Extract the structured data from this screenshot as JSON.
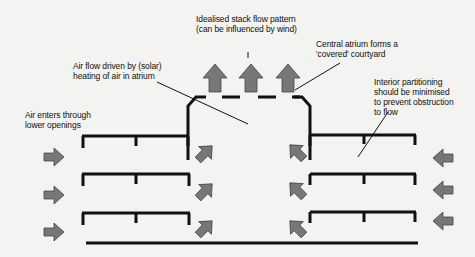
{
  "labels": {
    "stack_flow": "Idealised stack flow pattern\n(can be influenced by wind)",
    "atrium": "Central atrium forms a\n'covered' courtyard",
    "air_flow": "Air flow driven by (solar)\nheating of air in atrium",
    "air_enters": "Air enters through\nlower openings",
    "partitioning": "Interior partitioning\nshould be minimised\nto prevent obstruction\nto flow"
  },
  "colors": {
    "structure": "#111111",
    "arrow_fill": "#777777",
    "arrow_stroke": "#444444",
    "background": "#f3f3f1"
  }
}
